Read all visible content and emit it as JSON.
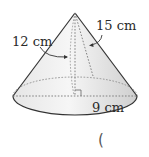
{
  "figure": {
    "shape": "cone",
    "labels": {
      "height": "12 cm",
      "slant_height": "15 cm",
      "radius": "9 cm"
    },
    "answer_blank": "("
  },
  "colors": {
    "outline": "#333333",
    "fill_light": "#f4f4f4",
    "fill_dark": "#d6d6d6",
    "dashed": "#777777",
    "text": "#2a2a2a"
  }
}
